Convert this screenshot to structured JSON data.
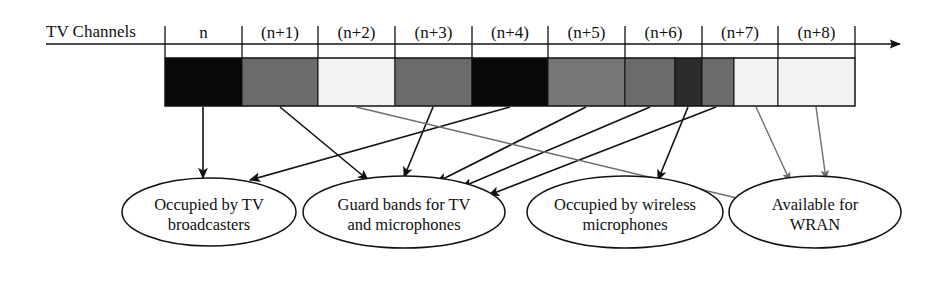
{
  "figure": {
    "axis_label": "TV Channels",
    "arrow_right_icon": "axis-arrow-right-icon"
  },
  "spectrum": {
    "bar_x": 165,
    "bar_y": 58,
    "bar_width": 690,
    "bar_height": 48,
    "channels": [
      {
        "label": "n",
        "tick_x": 165
      },
      {
        "label": "(n+1)",
        "tick_x": 242
      },
      {
        "label": "(n+2)",
        "tick_x": 318
      },
      {
        "label": "(n+3)",
        "tick_x": 395
      },
      {
        "label": "(n+4)",
        "tick_x": 472
      },
      {
        "label": "(n+5)",
        "tick_x": 548
      },
      {
        "label": "(n+6)",
        "tick_x": 625
      },
      {
        "label": "(n+7)",
        "tick_x": 702
      },
      {
        "label": "(n+8)",
        "tick_x": 778
      },
      {
        "label": "",
        "tick_x": 855
      }
    ],
    "segments": [
      {
        "x": 165,
        "width": 77,
        "fill": "#080808",
        "usage": "occupied-by-tv-broadcasters"
      },
      {
        "x": 242,
        "width": 76,
        "fill": "#6b6b6b",
        "usage": "guard-bands"
      },
      {
        "x": 318,
        "width": 77,
        "fill": "#f2f2f0",
        "usage": "available-for-wran"
      },
      {
        "x": 395,
        "width": 77,
        "fill": "#6b6b6b",
        "usage": "guard-bands"
      },
      {
        "x": 472,
        "width": 76,
        "fill": "#080808",
        "usage": "occupied-by-tv-broadcasters"
      },
      {
        "x": 548,
        "width": 77,
        "fill": "#767676",
        "usage": "guard-bands"
      },
      {
        "x": 625,
        "width": 50,
        "fill": "#6b6b6b",
        "usage": "guard-bands"
      },
      {
        "x": 675,
        "width": 27,
        "fill": "#2b2b2b",
        "usage": "occupied-by-wireless-microphones"
      },
      {
        "x": 702,
        "width": 32,
        "fill": "#6b6b6b",
        "usage": "guard-bands"
      },
      {
        "x": 734,
        "width": 44,
        "fill": "#f2f2f0",
        "usage": "available-for-wran"
      },
      {
        "x": 778,
        "width": 77,
        "fill": "#f2f2f0",
        "usage": "available-for-wran"
      }
    ],
    "colors": {
      "occupied_tv": "#080808",
      "guard_band": "#6b6b6b",
      "wireless_mic": "#2b2b2b",
      "available_wran": "#f2f2f0",
      "outline": "#111111",
      "gray_arrow": "#6e6e6e"
    }
  },
  "categories": [
    {
      "id": "occupied-by-tv-broadcasters",
      "line1": "Occupied by TV",
      "line2": "broadcasters",
      "cx": 209,
      "cy": 212,
      "rx": 87,
      "ry": 34
    },
    {
      "id": "guard-bands-for-tv-and-microphones",
      "line1": "Guard bands for TV",
      "line2": "and microphones",
      "cx": 404,
      "cy": 212,
      "rx": 101,
      "ry": 36
    },
    {
      "id": "occupied-by-wireless-microphones",
      "line1": "Occupied by wireless",
      "line2": "microphones",
      "cx": 625,
      "cy": 212,
      "rx": 98,
      "ry": 36
    },
    {
      "id": "available-for-wran",
      "line1": "Available for",
      "line2": "WRAN",
      "cx": 815,
      "cy": 212,
      "rx": 86,
      "ry": 36
    }
  ],
  "connectors": [
    {
      "name": "n-to-tv",
      "color": "black",
      "x1": 203,
      "y1": 107,
      "x2": 203,
      "y2": 178
    },
    {
      "name": "n4-to-tv",
      "color": "black",
      "x1": 510,
      "y1": 107,
      "x2": 250,
      "y2": 180
    },
    {
      "name": "n1-to-guard",
      "color": "black",
      "x1": 280,
      "y1": 107,
      "x2": 368,
      "y2": 180
    },
    {
      "name": "n3-to-guard",
      "color": "black",
      "x1": 433,
      "y1": 107,
      "x2": 404,
      "y2": 177
    },
    {
      "name": "n5-to-guard",
      "color": "black",
      "x1": 586,
      "y1": 107,
      "x2": 437,
      "y2": 182
    },
    {
      "name": "n6-to-guard",
      "color": "black",
      "x1": 650,
      "y1": 107,
      "x2": 462,
      "y2": 187
    },
    {
      "name": "n7a-to-guard",
      "color": "black",
      "x1": 716,
      "y1": 107,
      "x2": 489,
      "y2": 195
    },
    {
      "name": "mic-to-wireless",
      "color": "black",
      "x1": 688,
      "y1": 107,
      "x2": 658,
      "y2": 180
    },
    {
      "name": "n2-to-wran",
      "color": "gray",
      "x1": 356,
      "y1": 107,
      "x2": 745,
      "y2": 200
    },
    {
      "name": "n7b-to-wran",
      "color": "gray",
      "x1": 756,
      "y1": 107,
      "x2": 790,
      "y2": 181
    },
    {
      "name": "n8-to-wran",
      "color": "gray",
      "x1": 816,
      "y1": 107,
      "x2": 826,
      "y2": 179
    }
  ]
}
